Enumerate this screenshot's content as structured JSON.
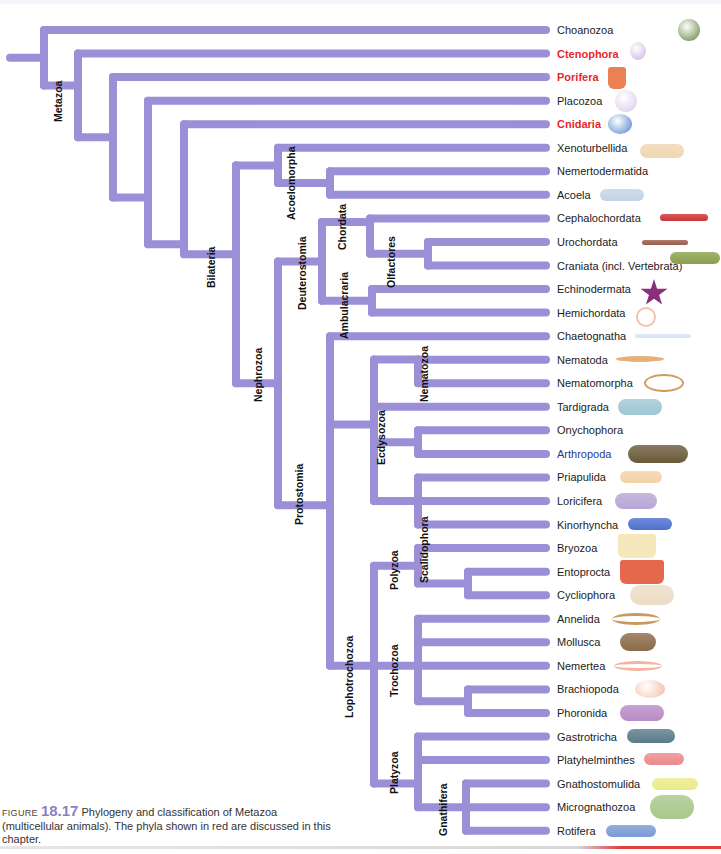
{
  "figure": {
    "caption_prefix": "Figure",
    "caption_number": "18.17",
    "caption_text": "Phylogeny and classification of Metazoa (multicellular animals). The phyla shown in red are discussed in this chapter."
  },
  "colors": {
    "branch": "#9b8fd8",
    "branch_dark": "#7e70c7",
    "halo": "#f6a48e",
    "highlight_text": "#e8282b",
    "link_text": "#2a3a8c"
  },
  "leaves": [
    {
      "name": "Choanozoa",
      "style": "normal",
      "icon": "choanoflagellate-icon"
    },
    {
      "name": "Ctenophora",
      "style": "red",
      "icon": "comb-jelly-icon"
    },
    {
      "name": "Porifera",
      "style": "red",
      "icon": "sponge-icon"
    },
    {
      "name": "Placozoa",
      "style": "normal",
      "icon": "placozoan-icon"
    },
    {
      "name": "Cnidaria",
      "style": "red",
      "icon": "jellyfish-icon"
    },
    {
      "name": "Xenoturbellida",
      "style": "normal",
      "icon": "xenoturbella-icon"
    },
    {
      "name": "Nemertodermatida",
      "style": "normal",
      "icon": ""
    },
    {
      "name": "Acoela",
      "style": "normal",
      "icon": "acoel-icon"
    },
    {
      "name": "Cephalochordata",
      "style": "normal",
      "icon": "lancelet-icon"
    },
    {
      "name": "Urochordata",
      "style": "normal",
      "icon": "tunicate-larva-icon"
    },
    {
      "name": "Craniata (incl. Vertebrata)",
      "style": "normal",
      "icon": "lamprey-icon"
    },
    {
      "name": "Echinodermata",
      "style": "normal",
      "icon": "starfish-icon"
    },
    {
      "name": "Hemichordata",
      "style": "normal",
      "icon": "acorn-worm-icon"
    },
    {
      "name": "Chaetognatha",
      "style": "normal",
      "icon": "arrow-worm-icon"
    },
    {
      "name": "Nematoda",
      "style": "normal",
      "icon": "roundworm-icon"
    },
    {
      "name": "Nematomorpha",
      "style": "normal",
      "icon": "horsehair-worm-icon"
    },
    {
      "name": "Tardigrada",
      "style": "normal",
      "icon": "tardigrade-icon"
    },
    {
      "name": "Onychophora",
      "style": "normal",
      "icon": ""
    },
    {
      "name": "Arthropoda",
      "style": "blue",
      "icon": "horseshoe-crab-icon"
    },
    {
      "name": "Priapulida",
      "style": "normal",
      "icon": "priapulid-icon"
    },
    {
      "name": "Loricifera",
      "style": "normal",
      "icon": "loriciferan-icon"
    },
    {
      "name": "Kinorhyncha",
      "style": "normal",
      "icon": "kinorhynch-icon"
    },
    {
      "name": "Bryozoa",
      "style": "normal",
      "icon": "bryozoan-icon"
    },
    {
      "name": "Entoprocta",
      "style": "normal",
      "icon": "entoproct-icon"
    },
    {
      "name": "Cycliophora",
      "style": "normal",
      "icon": "cycliophoran-icon"
    },
    {
      "name": "Annelida",
      "style": "normal",
      "icon": "earthworm-icon"
    },
    {
      "name": "Mollusca",
      "style": "normal",
      "icon": "snail-shell-icon"
    },
    {
      "name": "Nemertea",
      "style": "normal",
      "icon": "ribbon-worm-icon"
    },
    {
      "name": "Brachiopoda",
      "style": "normal",
      "icon": "brachiopod-icon"
    },
    {
      "name": "Phoronida",
      "style": "normal",
      "icon": "phoronid-icon"
    },
    {
      "name": "Gastrotricha",
      "style": "normal",
      "icon": "gastrotrich-icon"
    },
    {
      "name": "Platyhelminthes",
      "style": "normal",
      "icon": "flatworm-icon"
    },
    {
      "name": "Gnathostomulida",
      "style": "normal",
      "icon": "gnathostomulid-icon"
    },
    {
      "name": "Micrognathozoa",
      "style": "normal",
      "icon": "micrognathozoan-icon"
    },
    {
      "name": "Rotifera",
      "style": "normal",
      "icon": "rotifer-icon"
    }
  ],
  "clades": {
    "metazoa": "Metazoa",
    "bilateria": "Bilateria",
    "acoelomorpha": "Acoelomorpha",
    "nephrozoa": "Nephrozoa",
    "deuterostomia": "Deuterostomia",
    "chordata": "Chordata",
    "olfactores": "Olfactores",
    "ambulacraria": "Ambulacraria",
    "protostomia": "Protostomia",
    "ecdysozoa": "Ecdysozoa",
    "nematozoa": "Nematozoa",
    "scalidophora": "Scalidophora",
    "lophotrochozoa": "Lophotrochozoa",
    "polyzoa": "Polyzoa",
    "trochozoa": "Trochozoa",
    "platyzoa": "Platyzoa",
    "gnathifera": "Gnathifera"
  }
}
